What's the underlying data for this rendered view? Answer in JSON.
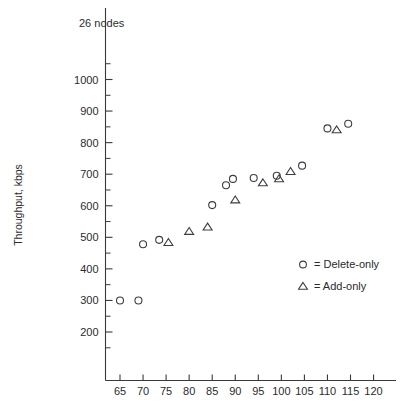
{
  "annotation": {
    "text": "26 nodes"
  },
  "axes": {
    "ylabel": "Throughput, kbps",
    "xlabel": "",
    "y_ticks": [
      200,
      300,
      400,
      500,
      600,
      700,
      800,
      900,
      1000
    ],
    "y_minor_ticks": [
      150,
      250,
      350,
      450,
      550,
      650,
      750,
      850,
      950,
      1050
    ],
    "x_ticks": [
      65,
      70,
      75,
      80,
      85,
      90,
      95,
      100,
      105,
      110,
      115,
      120
    ]
  },
  "legend": {
    "position": "inside-lower-right",
    "entries": [
      {
        "marker": "circle",
        "text": "= Delete-only"
      },
      {
        "marker": "triangle",
        "text": "= Add-only"
      }
    ]
  },
  "colors": {
    "marker": "#3c3c46",
    "axis": "#3a3a3a",
    "text": "#2b2b2b",
    "background": "#ffffff"
  },
  "chart_data": {
    "type": "scatter",
    "title": "",
    "subtitle": "",
    "annotations": [
      "26 nodes"
    ],
    "xlabel": "",
    "ylabel": "Throughput, kbps",
    "xlim": [
      61,
      123
    ],
    "ylim": [
      120,
      1060
    ],
    "grid": false,
    "legend_position": "inside-lower-right",
    "series": [
      {
        "name": "Delete-only",
        "marker": "circle",
        "points": [
          {
            "x": 65,
            "y": 300
          },
          {
            "x": 69,
            "y": 300
          },
          {
            "x": 70,
            "y": 478
          },
          {
            "x": 73.5,
            "y": 492
          },
          {
            "x": 85,
            "y": 602
          },
          {
            "x": 88,
            "y": 665
          },
          {
            "x": 89.5,
            "y": 685
          },
          {
            "x": 94,
            "y": 688
          },
          {
            "x": 99,
            "y": 695
          },
          {
            "x": 104.5,
            "y": 727
          },
          {
            "x": 110,
            "y": 845
          },
          {
            "x": 114.5,
            "y": 860
          }
        ]
      },
      {
        "name": "Add-only",
        "marker": "triangle",
        "points": [
          {
            "x": 75.5,
            "y": 483
          },
          {
            "x": 80,
            "y": 518
          },
          {
            "x": 84,
            "y": 532
          },
          {
            "x": 90,
            "y": 618
          },
          {
            "x": 96,
            "y": 672
          },
          {
            "x": 99.5,
            "y": 685
          },
          {
            "x": 102,
            "y": 708
          },
          {
            "x": 112,
            "y": 840
          }
        ]
      }
    ]
  }
}
